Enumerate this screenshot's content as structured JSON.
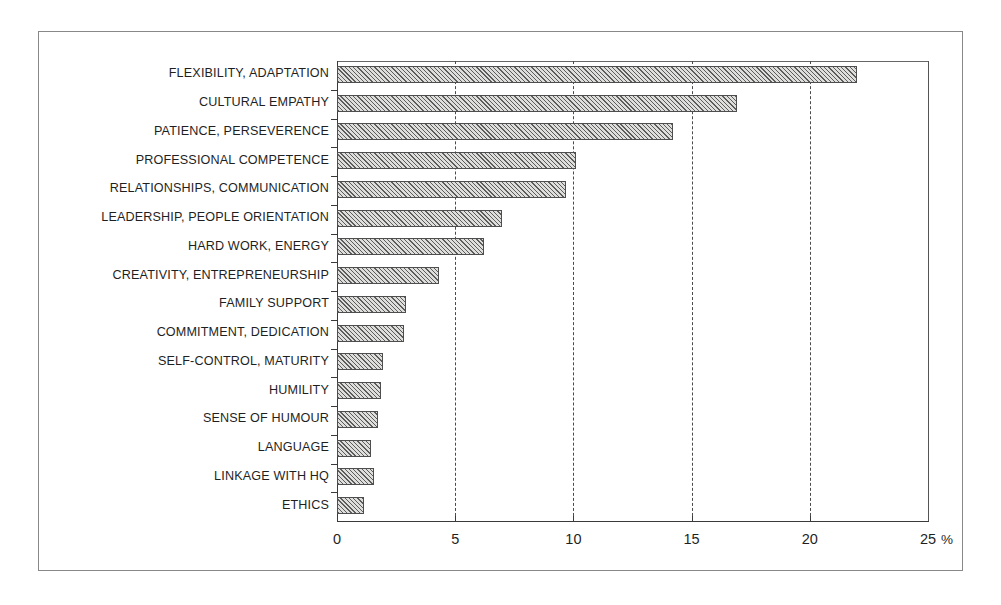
{
  "chart_data": {
    "type": "bar",
    "orientation": "horizontal",
    "title": "",
    "xlabel": "%",
    "ylabel": "",
    "xlim": [
      0,
      25
    ],
    "xticks": [
      0,
      5,
      10,
      15,
      20,
      25
    ],
    "xtick_labels": [
      "0",
      "5",
      "10",
      "15",
      "20",
      "25"
    ],
    "grid": "vertical dashed at 5, 10, 15, 20",
    "legend": "none",
    "categories": [
      "FLEXIBILITY, ADAPTATION",
      "CULTURAL EMPATHY",
      "PATIENCE, PERSEVERENCE",
      "PROFESSIONAL COMPETENCE",
      "RELATIONSHIPS, COMMUNICATION",
      "LEADERSHIP, PEOPLE ORIENTATION",
      "HARD WORK, ENERGY",
      "CREATIVITY, ENTREPRENEURSHIP",
      "FAMILY SUPPORT",
      "COMMITMENT, DEDICATION",
      "SELF-CONTROL, MATURITY",
      "HUMILITY",
      "SENSE OF HUMOUR",
      "LANGUAGE",
      "LINKAGE WITH HQ",
      "ETHICS"
    ],
    "values": [
      22.0,
      16.9,
      14.2,
      10.1,
      9.7,
      7.0,
      6.2,
      4.3,
      2.9,
      2.85,
      1.95,
      1.85,
      1.75,
      1.45,
      1.55,
      1.15
    ]
  },
  "axis": {
    "unit_label": "%",
    "tick_0": "0",
    "tick_5": "5",
    "tick_10": "10",
    "tick_15": "15",
    "tick_20": "20",
    "tick_25": "25"
  }
}
